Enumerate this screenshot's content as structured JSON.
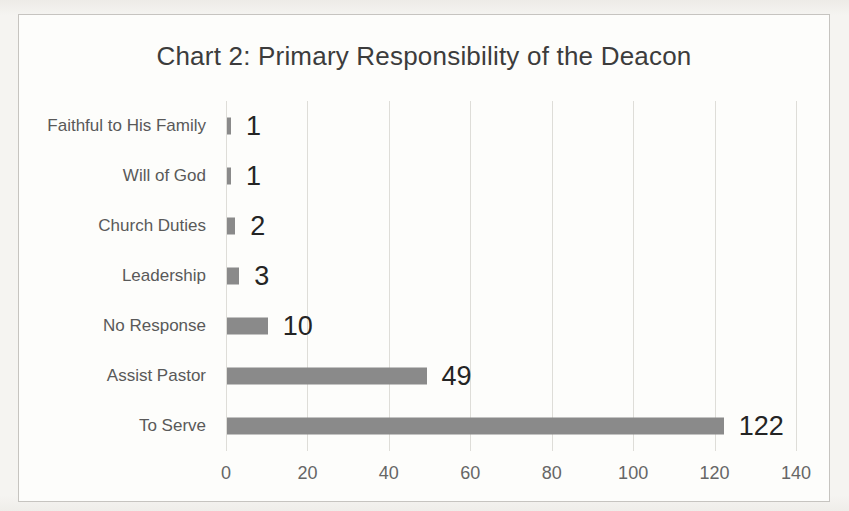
{
  "chart_data": {
    "type": "bar",
    "orientation": "horizontal",
    "title": "Chart 2: Primary Responsibility of the Deacon",
    "categories": [
      "Faithful to His Family",
      "Will of God",
      "Church Duties",
      "Leadership",
      "No Response",
      "Assist Pastor",
      "To Serve"
    ],
    "values": [
      1,
      1,
      2,
      3,
      10,
      49,
      122
    ],
    "data_labels": [
      "1",
      "1",
      "2",
      "3",
      "10",
      "49",
      "122"
    ],
    "xlabel": "",
    "ylabel": "",
    "xlim": [
      0,
      140
    ],
    "x_ticks": [
      0,
      20,
      40,
      60,
      80,
      100,
      120,
      140
    ],
    "x_tick_labels": [
      "0",
      "20",
      "40",
      "60",
      "80",
      "100",
      "120",
      "140"
    ],
    "legend": "none",
    "grid": "vertical",
    "colors": {
      "bar": "#8a8a8a",
      "title_text": "#3c3c3c",
      "category_text": "#595959",
      "value_text": "#242424",
      "tick_text": "#666666",
      "gridline": "#deddd8",
      "frame_border": "#c6c4c0",
      "chart_background": "#fdfdfb",
      "page_background": "#f3f2ee"
    }
  }
}
